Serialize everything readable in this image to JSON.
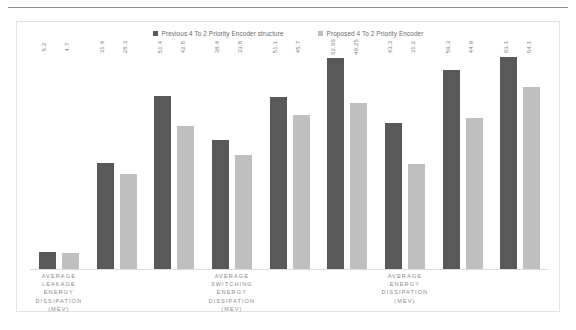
{
  "chart_data": {
    "type": "bar",
    "title": "",
    "subtitle": "",
    "xlabel": "",
    "ylabel": "",
    "grid": false,
    "legend_position": "top-center",
    "ylim": [
      0,
      66
    ],
    "categories": [
      "",
      "",
      "",
      "",
      "",
      "",
      "",
      "",
      ""
    ],
    "category_axis_labels": [
      {
        "lines": [
          "AVERAGE",
          "LEAKAGE",
          "ENERGY",
          "DISSIPATION",
          "(MEV)"
        ]
      },
      {
        "lines": [
          "AVERAGE",
          "SWITCHING",
          "ENERGY",
          "DISSIPATION",
          "(MEV)"
        ]
      },
      {
        "lines": [
          "AVERAGE",
          "ENERGY",
          "DISSIPATION",
          "(MEV)"
        ]
      }
    ],
    "series": [
      {
        "name": "Previous 4 To 2 Priority Encoder structure",
        "color": "#595959",
        "values": [
          5.2,
          31.4,
          51.4,
          38.4,
          51.1,
          62.66,
          43.3,
          59.3,
          63.1
        ]
      },
      {
        "name": "Proposed 4 To 2 Priority Encoder",
        "color": "#bfbfbf",
        "values": [
          4.7,
          28.3,
          42.5,
          33.8,
          45.7,
          49.25,
          31.2,
          44.9,
          54.1
        ]
      }
    ]
  },
  "legend": {
    "items": [
      {
        "label": "Previous 4 To 2 Priority Encoder structure",
        "color": "#595959",
        "marker": "square-marker"
      },
      {
        "label": "Proposed 4 To 2 Priority Encoder",
        "color": "#bfbfbf",
        "marker": "square-marker"
      }
    ]
  }
}
